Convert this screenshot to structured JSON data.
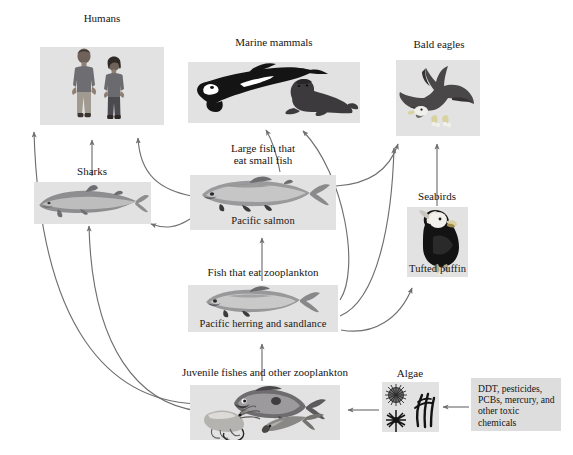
{
  "diagram": {
    "accent_gray": "#e2e2e2",
    "arrow_color": "#6f6f72",
    "background": "#ffffff"
  },
  "nodes": {
    "humans": {
      "top_label": "Humans",
      "caption": "",
      "icon": "two-people-illustration"
    },
    "marine_mammals": {
      "top_label": "Marine mammals",
      "caption": "",
      "icon": "orca-and-sea-lion-illustration"
    },
    "bald_eagles": {
      "top_label": "Bald eagles",
      "caption": "",
      "icon": "bald-eagle-illustration"
    },
    "sharks": {
      "top_label": "Sharks",
      "caption": "",
      "icon": "shark-illustration"
    },
    "large_fish": {
      "top_label": "Large fish that\neat small fish",
      "caption": "Pacific salmon",
      "icon": "salmon-illustration"
    },
    "seabirds": {
      "top_label": "Seabirds",
      "caption": "Tufted puffin",
      "icon": "tufted-puffin-illustration"
    },
    "zooplankton_fish": {
      "top_label": "Fish that eat zooplankton",
      "caption": "Pacific herring and sandlance",
      "icon": "herring-illustration"
    },
    "juvenile_zooplankton": {
      "top_label": "Juvenile fishes and other zooplankton",
      "caption": "",
      "icon": "juvenile-fish-and-krill-illustration"
    },
    "algae": {
      "top_label": "Algae",
      "caption": "",
      "icon": "algae-illustration"
    },
    "toxics": {
      "top_label": "",
      "caption": "DDT, pesticides, PCBs, mercury, and other toxic chemicals",
      "icon": "toxic-chemicals-text-box"
    }
  },
  "arrows": [
    {
      "from": "juvenile_zooplankton",
      "to": "humans"
    },
    {
      "from": "juvenile_zooplankton",
      "to": "sharks"
    },
    {
      "from": "sharks",
      "to": "humans"
    },
    {
      "from": "large_fish",
      "to": "humans"
    },
    {
      "from": "large_fish",
      "to": "sharks"
    },
    {
      "from": "large_fish",
      "to": "marine_mammals"
    },
    {
      "from": "large_fish",
      "to": "bald_eagles"
    },
    {
      "from": "zooplankton_fish",
      "to": "large_fish"
    },
    {
      "from": "zooplankton_fish",
      "to": "marine_mammals"
    },
    {
      "from": "zooplankton_fish",
      "to": "bald_eagles"
    },
    {
      "from": "zooplankton_fish",
      "to": "seabirds"
    },
    {
      "from": "juvenile_zooplankton",
      "to": "zooplankton_fish"
    },
    {
      "from": "seabirds",
      "to": "bald_eagles"
    },
    {
      "from": "algae",
      "to": "juvenile_zooplankton"
    },
    {
      "from": "toxics",
      "to": "algae"
    }
  ]
}
